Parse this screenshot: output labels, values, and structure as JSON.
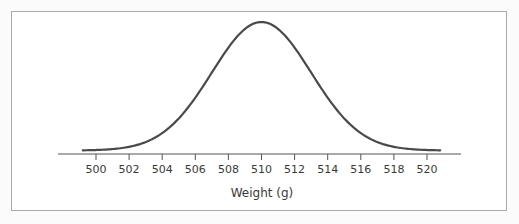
{
  "chart_data": {
    "type": "line",
    "title": "",
    "subtitle": "",
    "xlabel": "Weight (g)",
    "ylabel": "",
    "distribution": {
      "kind": "normal",
      "mean": 510,
      "sd": 3
    },
    "x_ticks": [
      500,
      502,
      504,
      506,
      508,
      510,
      512,
      514,
      516,
      518,
      520
    ],
    "xlim": [
      497.7,
      522.1
    ],
    "curve_x_range": [
      499.2,
      520.8
    ],
    "y_axis_shown": false,
    "grid": false,
    "legend": null,
    "colors": {
      "curve": "#4a4a4a",
      "axis": "#555555",
      "frame": "#a9a9a9"
    }
  },
  "axis": {
    "xlabel": "Weight (g)",
    "ticks": [
      "500",
      "502",
      "504",
      "506",
      "508",
      "510",
      "512",
      "514",
      "516",
      "518",
      "520"
    ]
  }
}
